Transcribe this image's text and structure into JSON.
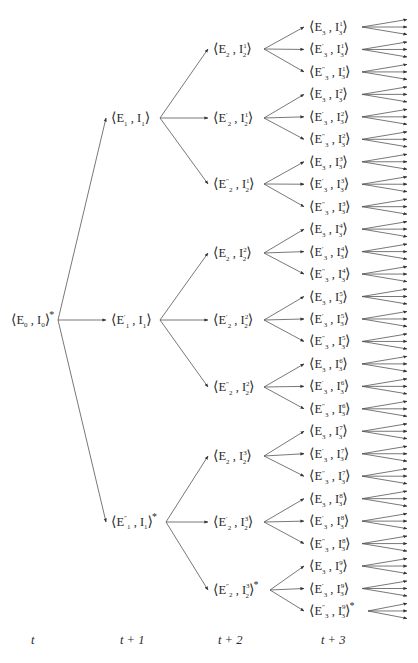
{
  "diagram": {
    "line_color": "#555555",
    "time_labels": [
      {
        "text": "t",
        "x": 31
      },
      {
        "text": "t + 1",
        "x": 120
      },
      {
        "text": "t + 2",
        "x": 218
      },
      {
        "text": "t + 3",
        "x": 321
      }
    ],
    "root": {
      "E": "E",
      "E_sub": "0",
      "E_prime": "",
      "I_sub": "0",
      "I_sup": "",
      "star": true,
      "x": 10,
      "y": 320,
      "anchor_x": 58
    },
    "level1": [
      {
        "E_sub": "1",
        "E_prime": "",
        "I_sub": "1",
        "I_sup": "",
        "star": false,
        "y": 118
      },
      {
        "E_sub": "1",
        "E_prime": "′",
        "I_sub": "1",
        "I_sup": "",
        "star": false,
        "y": 320
      },
      {
        "E_sub": "1",
        "E_prime": "″",
        "I_sub": "1",
        "I_sup": "",
        "star": true,
        "y": 522
      }
    ],
    "level2": [
      {
        "E_sub": "2",
        "E_prime": "",
        "I_sub": "2",
        "I_sup": "1",
        "star": false,
        "y": 49
      },
      {
        "E_sub": "2",
        "E_prime": "′",
        "I_sub": "2",
        "I_sup": "1",
        "star": false,
        "y": 118
      },
      {
        "E_sub": "2",
        "E_prime": "″",
        "I_sub": "2",
        "I_sup": "1",
        "star": false,
        "y": 184
      },
      {
        "E_sub": "2",
        "E_prime": "",
        "I_sub": "2",
        "I_sup": "2",
        "star": false,
        "y": 253
      },
      {
        "E_sub": "2",
        "E_prime": "′",
        "I_sub": "2",
        "I_sup": "2",
        "star": false,
        "y": 320
      },
      {
        "E_sub": "2",
        "E_prime": "″",
        "I_sub": "2",
        "I_sup": "2",
        "star": false,
        "y": 387
      },
      {
        "E_sub": "2",
        "E_prime": "",
        "I_sub": "2",
        "I_sup": "3",
        "star": false,
        "y": 456
      },
      {
        "E_sub": "2",
        "E_prime": "′",
        "I_sub": "2",
        "I_sup": "3",
        "star": false,
        "y": 522
      },
      {
        "E_sub": "2",
        "E_prime": "″",
        "I_sub": "2",
        "I_sup": "3",
        "star": true,
        "y": 590
      }
    ],
    "level3": [
      {
        "E_prime": "",
        "I_sup": "1"
      },
      {
        "E_prime": "′",
        "I_sup": "1"
      },
      {
        "E_prime": "″",
        "I_sup": "1"
      },
      {
        "E_prime": "",
        "I_sup": "2"
      },
      {
        "E_prime": "′",
        "I_sup": "2"
      },
      {
        "E_prime": "″",
        "I_sup": "2"
      },
      {
        "E_prime": "",
        "I_sup": "3"
      },
      {
        "E_prime": "′",
        "I_sup": "3"
      },
      {
        "E_prime": "″",
        "I_sup": "3"
      },
      {
        "E_prime": "",
        "I_sup": "4"
      },
      {
        "E_prime": "′",
        "I_sup": "4"
      },
      {
        "E_prime": "″",
        "I_sup": "4"
      },
      {
        "E_prime": "",
        "I_sup": "5"
      },
      {
        "E_prime": "′",
        "I_sup": "5"
      },
      {
        "E_prime": "″",
        "I_sup": "5"
      },
      {
        "E_prime": "",
        "I_sup": "6"
      },
      {
        "E_prime": "′",
        "I_sup": "6"
      },
      {
        "E_prime": "″",
        "I_sup": "6"
      },
      {
        "E_prime": "",
        "I_sup": "7"
      },
      {
        "E_prime": "′",
        "I_sup": "7"
      },
      {
        "E_prime": "″",
        "I_sup": "7"
      },
      {
        "E_prime": "",
        "I_sup": "8"
      },
      {
        "E_prime": "′",
        "I_sup": "8"
      },
      {
        "E_prime": "″",
        "I_sup": "8"
      },
      {
        "E_prime": "",
        "I_sup": "9"
      },
      {
        "E_prime": "′",
        "I_sup": "9"
      },
      {
        "E_prime": "″",
        "I_sup": "9",
        "star": true
      }
    ],
    "level3_layout": {
      "E_sub": "3",
      "I_sub": "3",
      "y_start": 27,
      "y_step": 22.46
    },
    "columns": {
      "level1_x": 110,
      "level1_anchor_x": 160,
      "level1_right_star": 166,
      "level2_x": 212,
      "level2_anchor_x": 264,
      "level3_x": 308,
      "level3_anchor_x": 362,
      "leaf_end_x": 407,
      "leaf_spread": 7.5
    }
  }
}
